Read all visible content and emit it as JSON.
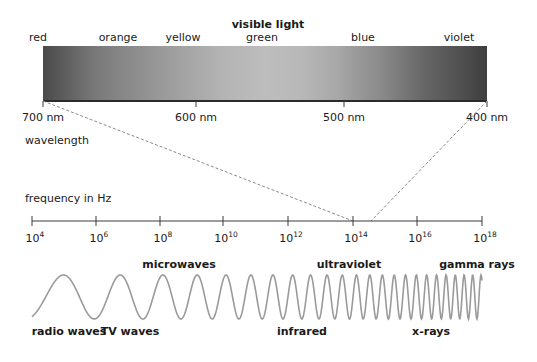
{
  "title": "visible light",
  "visible_colors": [
    {
      "label": "red",
      "x": 38
    },
    {
      "label": "orange",
      "x": 118
    },
    {
      "label": "yellow",
      "x": 183
    },
    {
      "label": "green",
      "x": 262
    },
    {
      "label": "blue",
      "x": 363
    },
    {
      "label": "violet",
      "x": 459
    }
  ],
  "wavelength_ticks": [
    {
      "label": "700 nm",
      "x": 43
    },
    {
      "label": "600 nm",
      "x": 196
    },
    {
      "label": "500 nm",
      "x": 344
    },
    {
      "label": "400 nm",
      "x": 487
    }
  ],
  "wavelength_label": "wavelength",
  "frequency_label": "frequency in Hz",
  "frequency_ticks": [
    {
      "base": "10",
      "exp": "4",
      "x": 32
    },
    {
      "base": "10",
      "exp": "6",
      "x": 96
    },
    {
      "base": "10",
      "exp": "8",
      "x": 160
    },
    {
      "base": "10",
      "exp": "10",
      "x": 223
    },
    {
      "base": "10",
      "exp": "12",
      "x": 288
    },
    {
      "base": "10",
      "exp": "14",
      "x": 353
    },
    {
      "base": "10",
      "exp": "16",
      "x": 417
    },
    {
      "base": "10",
      "exp": "18",
      "x": 482
    }
  ],
  "wave_labels_top": [
    {
      "label": "microwaves",
      "x": 179
    },
    {
      "label": "ultraviolet",
      "x": 349
    },
    {
      "label": "gamma rays",
      "x": 477
    }
  ],
  "wave_labels_bottom": [
    {
      "label": "radio waves",
      "x": 69
    },
    {
      "label": "TV waves",
      "x": 130
    },
    {
      "label": "infrared",
      "x": 302
    },
    {
      "label": "x-rays",
      "x": 431
    }
  ],
  "colors": {
    "spectrum_dark": "#4a4a4a",
    "spectrum_light": "#bdbdbd",
    "wave": "#9a9a9a",
    "dashed": "#8a8a8a",
    "axis": "#3a3a3a",
    "text": "#1a1a1a"
  }
}
